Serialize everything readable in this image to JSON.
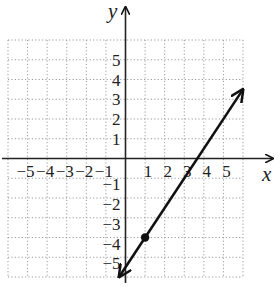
{
  "chart_data": {
    "type": "line",
    "title": "",
    "xlabel": "x",
    "ylabel": "y",
    "xlim": [
      -6,
      6
    ],
    "ylim": [
      -6,
      6
    ],
    "grid": true,
    "grid_style": "dotted",
    "x_ticks": [
      -5,
      -4,
      -3,
      -2,
      -1,
      1,
      2,
      3,
      4,
      5
    ],
    "y_ticks": [
      5,
      4,
      3,
      2,
      1,
      -1,
      -2,
      -3,
      -4,
      -5
    ],
    "x_tick_labels": [
      "−5",
      "−4",
      "−3",
      "−2",
      "−1",
      "1",
      "2",
      "3",
      "4",
      "5"
    ],
    "y_tick_labels": [
      "5",
      "4",
      "3",
      "2",
      "1",
      "−1",
      "−2",
      "−3",
      "−4",
      "−5"
    ],
    "series": [
      {
        "name": "line",
        "equation": "y = 1.5x - 5.5",
        "slope": 1.5,
        "y_intercept": -5.5,
        "x_intercept": 3.67,
        "x": [
          -0.33,
          6
        ],
        "y": [
          -6,
          3.5
        ],
        "arrows": "both ends"
      }
    ],
    "points": [
      {
        "x": 1,
        "y": -4,
        "style": "filled dot"
      }
    ],
    "colors": {
      "line": "#111111",
      "grid": "#9a9a9a",
      "axes": "#222222"
    }
  }
}
